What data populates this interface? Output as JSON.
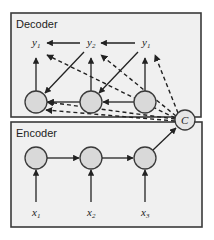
{
  "decoder": {
    "title": "Decoder",
    "outputs": [
      {
        "base": "y",
        "sub": "1"
      },
      {
        "base": "y",
        "sub": "2"
      },
      {
        "base": "y",
        "sub": "1"
      }
    ]
  },
  "encoder": {
    "title": "Encoder",
    "inputs": [
      {
        "base": "x",
        "sub": "1"
      },
      {
        "base": "x",
        "sub": "2"
      },
      {
        "base": "x",
        "sub": "3"
      }
    ]
  },
  "context": {
    "label": "C"
  },
  "colors": {
    "box_fill": "#f0f0f0",
    "node_fill": "#d9d9d9",
    "stroke": "#222222"
  }
}
